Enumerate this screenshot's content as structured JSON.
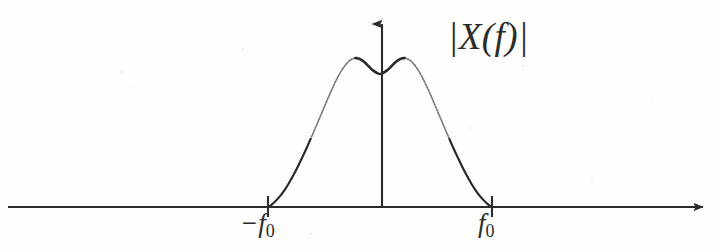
{
  "figure": {
    "kind": "signal-spectrum-diagram",
    "background_color": "#fdfdfc",
    "ink_color": "#2b2b2b",
    "amplitude_label": "|X(f)|",
    "axis": {
      "horizontal": {
        "name": "frequency-axis",
        "arrow_end": "right",
        "y_px": 207,
        "x_start_px": 8,
        "x_end_px": 712
      },
      "vertical": {
        "name": "magnitude-axis",
        "arrow_end": "up",
        "x_px": 382,
        "y_top_px": 14,
        "y_bottom_px": 207
      }
    },
    "ticks": [
      {
        "name": "tick-neg-f0",
        "label": "−f",
        "subscript": "0",
        "x_px": 268
      },
      {
        "name": "tick-pos-f0",
        "label": "f",
        "subscript": "0",
        "x_px": 492
      }
    ]
  },
  "chart_data": {
    "type": "line",
    "title": "|X(f)|",
    "xlabel": "f",
    "ylabel": "|X(f)|",
    "grid": false,
    "legend": "none",
    "xlim": [
      -1.55,
      1.55
    ],
    "ylim": [
      0,
      1.0
    ],
    "xticks": [
      -1,
      1
    ],
    "xticklabels": [
      "−f₀",
      "f₀"
    ],
    "series": [
      {
        "name": "|X(f)|",
        "color": "#2b2b2b",
        "x": [
          -1.0,
          -0.97,
          -0.94,
          -0.9,
          -0.86,
          -0.82,
          -0.78,
          -0.74,
          -0.7,
          -0.66,
          -0.62,
          -0.58,
          -0.54,
          -0.5,
          -0.46,
          -0.42,
          -0.38,
          -0.34,
          -0.3,
          -0.26,
          -0.22,
          -0.18,
          -0.14,
          -0.1,
          -0.06,
          -0.02,
          0.0,
          0.02,
          0.06,
          0.1,
          0.14,
          0.18,
          0.22,
          0.26,
          0.3,
          0.34,
          0.38,
          0.42,
          0.46,
          0.5,
          0.54,
          0.58,
          0.62,
          0.66,
          0.7,
          0.74,
          0.78,
          0.82,
          0.86,
          0.9,
          0.94,
          0.97,
          1.0
        ],
        "y": [
          0.0,
          0.012,
          0.03,
          0.058,
          0.092,
          0.132,
          0.178,
          0.228,
          0.282,
          0.338,
          0.398,
          0.458,
          0.52,
          0.582,
          0.644,
          0.702,
          0.756,
          0.802,
          0.838,
          0.862,
          0.872,
          0.866,
          0.848,
          0.822,
          0.798,
          0.782,
          0.778,
          0.782,
          0.798,
          0.822,
          0.848,
          0.866,
          0.872,
          0.862,
          0.838,
          0.802,
          0.756,
          0.702,
          0.644,
          0.582,
          0.52,
          0.458,
          0.398,
          0.338,
          0.282,
          0.228,
          0.178,
          0.132,
          0.092,
          0.058,
          0.03,
          0.012,
          0.0
        ],
        "annotations": [
          {
            "name": "left-peak",
            "x": -0.22,
            "y": 0.872
          },
          {
            "name": "center-dip",
            "x": 0.0,
            "y": 0.778
          },
          {
            "name": "right-peak",
            "x": 0.22,
            "y": 0.872
          }
        ]
      }
    ]
  }
}
